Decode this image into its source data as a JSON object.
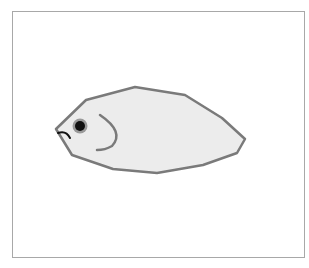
{
  "figure": {
    "colors": {
      "frame_border": "#a8a8a8",
      "body_fill": "#ececec",
      "body_stroke": "#7a7a7a",
      "eye": "#111111",
      "mouth": "#111111",
      "gill": "#7a7a7a"
    }
  }
}
